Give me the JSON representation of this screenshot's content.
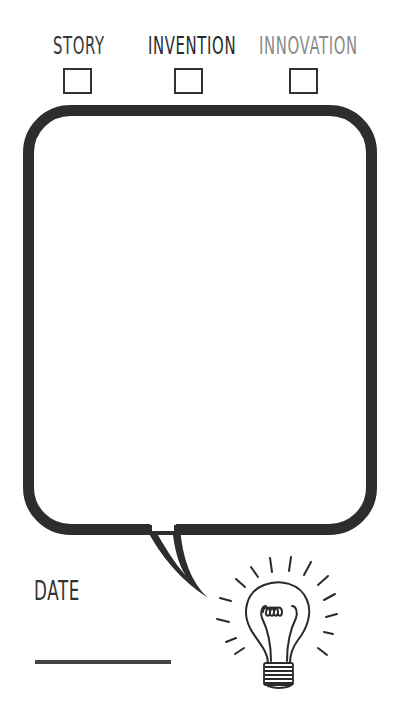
{
  "categories": [
    {
      "label": "STORY",
      "color": "#3a3a3a",
      "checked": false
    },
    {
      "label": "INVENTION",
      "color": "#2a2a2a",
      "checked": false
    },
    {
      "label": "INNOVATION",
      "color": "#8a8a8a",
      "checked": false
    }
  ],
  "speech_bubble": {
    "text": "",
    "stroke_color": "#2d2d2d"
  },
  "date": {
    "label": "DATE",
    "value": ""
  },
  "illustration": {
    "icon": "lightbulb-icon"
  }
}
